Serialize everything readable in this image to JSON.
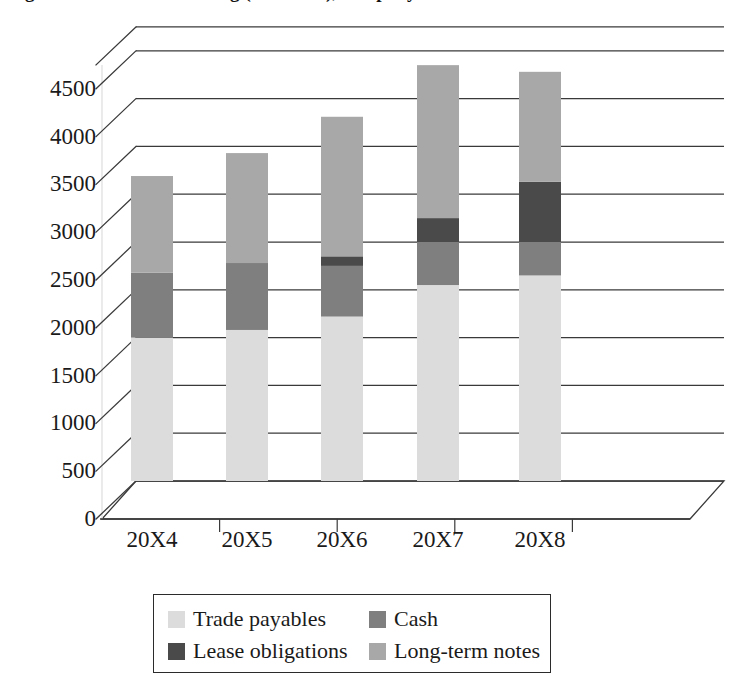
{
  "chart_data": {
    "type": "bar",
    "subtype": "stacked-column-3d",
    "title": "Figure: Sources of financing (liabilities), company",
    "categories": [
      "20X4",
      "20X5",
      "20X6",
      "20X7",
      "20X8"
    ],
    "series": [
      {
        "name": "Trade payables",
        "color": "#dcdcdc",
        "values": [
          1500,
          1580,
          1720,
          2050,
          2150
        ]
      },
      {
        "name": "Cash",
        "color": "#7f7f7f",
        "values": [
          680,
          700,
          530,
          450,
          350
        ]
      },
      {
        "name": "Lease obligations",
        "color": "#4a4a4a",
        "values": [
          0,
          0,
          100,
          250,
          630
        ]
      },
      {
        "name": "Long-term notes",
        "color": "#a8a8a8",
        "values": [
          1010,
          1150,
          1460,
          1600,
          1150
        ]
      }
    ],
    "totals": [
      3190,
      3430,
      3810,
      4350,
      4280
    ],
    "xlabel": "",
    "ylabel": "",
    "ylim": [
      0,
      4750
    ],
    "yticks": [
      0,
      500,
      1000,
      1500,
      2000,
      2500,
      3000,
      3500,
      4000,
      4500
    ],
    "grid": true,
    "legend_position": "bottom"
  },
  "axis": {
    "yticks": [
      "0",
      "500",
      "1000",
      "1500",
      "2000",
      "2500",
      "3000",
      "3500",
      "4000",
      "4500"
    ],
    "xticks": [
      "20X4",
      "20X5",
      "20X6",
      "20X7",
      "20X8"
    ]
  },
  "legend": {
    "items": [
      {
        "label": "Trade payables",
        "color": "#dcdcdc"
      },
      {
        "label": "Cash",
        "color": "#7f7f7f"
      },
      {
        "label": "Lease obligations",
        "color": "#4a4a4a"
      },
      {
        "label": "Long-term notes",
        "color": "#a8a8a8"
      }
    ]
  },
  "title": "Figure: Sources of financing (liabilities), company"
}
